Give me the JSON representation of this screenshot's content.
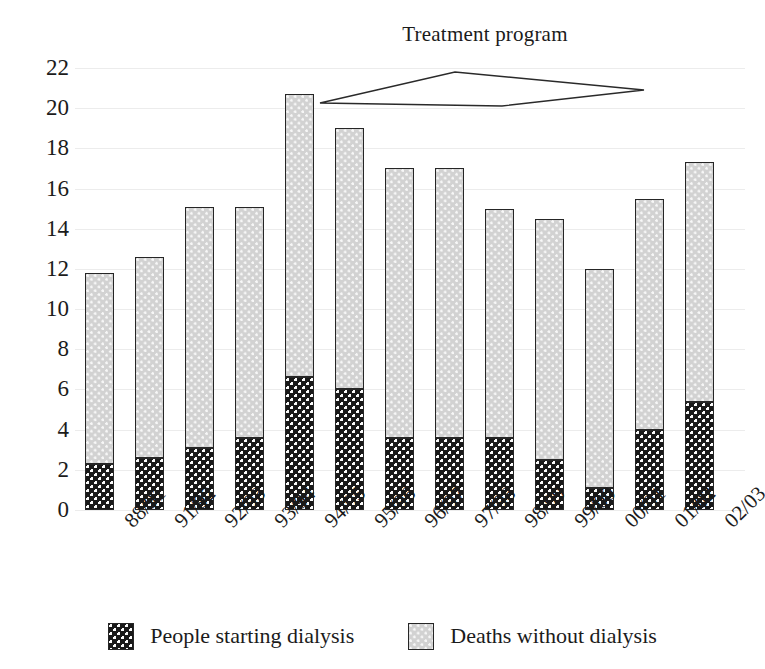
{
  "annotation": {
    "label": "Treatment program",
    "shape": "diamond-bracket"
  },
  "legend": {
    "items": [
      {
        "key": "dark",
        "label": "People starting dialysis",
        "color": "#191919",
        "pattern": "checkered"
      },
      {
        "key": "light",
        "label": "Deaths without dialysis",
        "color": "#d2d2d2",
        "pattern": "dotted"
      }
    ]
  },
  "axes": {
    "y_ticks": [
      "22",
      "20",
      "18",
      "16",
      "14",
      "12",
      "10",
      "8",
      "6",
      "4",
      "2",
      "0"
    ],
    "x_ticks": [
      "88/91",
      "91/92",
      "92/93",
      "93/94",
      "94/95",
      "95/96",
      "96/97",
      "97/98",
      "98/99",
      "99/00",
      "00/01",
      "01/02",
      "02/03"
    ]
  },
  "chart_data": {
    "type": "bar",
    "stacked": true,
    "title": "",
    "annotation": "Treatment program",
    "xlabel": "",
    "ylabel": "",
    "ylim": [
      0,
      22
    ],
    "ytick_step": 2,
    "grid": true,
    "legend_position": "bottom",
    "categories": [
      "88/91",
      "91/92",
      "92/93",
      "93/94",
      "94/95",
      "95/96",
      "96/97",
      "97/98",
      "98/99",
      "99/00",
      "00/01",
      "01/02",
      "02/03"
    ],
    "series": [
      {
        "name": "People starting dialysis",
        "color": "#191919",
        "pattern": "checkered",
        "values": [
          2.3,
          2.6,
          3.1,
          3.6,
          6.6,
          6.0,
          3.6,
          3.6,
          3.6,
          2.5,
          1.1,
          4.0,
          5.4
        ]
      },
      {
        "name": "Deaths without dialysis",
        "color": "#d2d2d2",
        "pattern": "dotted",
        "values": [
          9.5,
          10.0,
          12.0,
          11.5,
          14.1,
          13.0,
          13.4,
          13.4,
          11.4,
          12.0,
          10.9,
          11.5,
          11.9
        ]
      }
    ],
    "totals": [
      11.8,
      12.6,
      15.1,
      15.1,
      20.7,
      19.0,
      17.0,
      17.0,
      15.0,
      14.5,
      12.0,
      15.5,
      17.3
    ]
  }
}
